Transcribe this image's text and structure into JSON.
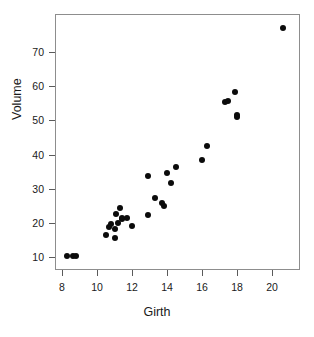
{
  "chart_data": {
    "type": "scatter",
    "title": "",
    "xlabel": "Girth",
    "ylabel": "Volume",
    "xlim": [
      8.0,
      21.2
    ],
    "ylim": [
      8.0,
      78.5
    ],
    "xticks": [
      8,
      10,
      12,
      14,
      16,
      18,
      20
    ],
    "xticklabels": [
      "8",
      "10",
      "12",
      "14",
      "16",
      "18",
      "20"
    ],
    "yticks": [
      10,
      20,
      30,
      40,
      50,
      60,
      70
    ],
    "yticklabels": [
      "10",
      "20",
      "30",
      "40",
      "50",
      "60",
      "70"
    ],
    "grid": false,
    "legend": null,
    "marker": "filled-circle",
    "marker_color": "#0b0b0b",
    "frame_color": "#8d8d8d",
    "points": [
      {
        "x": 8.3,
        "y": 10.3
      },
      {
        "x": 8.6,
        "y": 10.3
      },
      {
        "x": 8.8,
        "y": 10.2
      },
      {
        "x": 10.5,
        "y": 16.4
      },
      {
        "x": 10.7,
        "y": 18.8
      },
      {
        "x": 10.8,
        "y": 19.7
      },
      {
        "x": 11.0,
        "y": 15.6
      },
      {
        "x": 11.0,
        "y": 18.2
      },
      {
        "x": 11.1,
        "y": 22.6
      },
      {
        "x": 11.2,
        "y": 19.9
      },
      {
        "x": 11.3,
        "y": 24.2
      },
      {
        "x": 11.4,
        "y": 21.0
      },
      {
        "x": 11.4,
        "y": 21.4
      },
      {
        "x": 11.7,
        "y": 21.3
      },
      {
        "x": 12.0,
        "y": 19.1
      },
      {
        "x": 12.9,
        "y": 22.2
      },
      {
        "x": 12.9,
        "y": 33.8
      },
      {
        "x": 13.3,
        "y": 27.4
      },
      {
        "x": 13.7,
        "y": 25.7
      },
      {
        "x": 13.8,
        "y": 24.9
      },
      {
        "x": 14.0,
        "y": 34.5
      },
      {
        "x": 14.2,
        "y": 31.7
      },
      {
        "x": 14.5,
        "y": 36.3
      },
      {
        "x": 16.0,
        "y": 38.3
      },
      {
        "x": 16.3,
        "y": 42.6
      },
      {
        "x": 17.3,
        "y": 55.4
      },
      {
        "x": 17.5,
        "y": 55.7
      },
      {
        "x": 17.9,
        "y": 58.3
      },
      {
        "x": 18.0,
        "y": 51.5
      },
      {
        "x": 18.0,
        "y": 51.0
      },
      {
        "x": 20.6,
        "y": 77.0
      }
    ]
  },
  "axes": {
    "x_title": "Girth",
    "y_title": "Volume"
  }
}
